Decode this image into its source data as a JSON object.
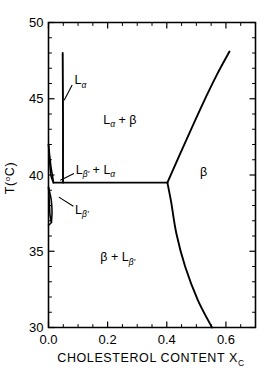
{
  "chart_data": {
    "type": "line",
    "title": "",
    "xlabel": "CHOLESTEROL CONTENT X",
    "xlabel_sub": "C",
    "ylabel": "T(",
    "ylabel_sup": "o",
    "ylabel_tail": "C)",
    "xlim": [
      0.0,
      0.7
    ],
    "ylim": [
      30,
      50
    ],
    "grid": false,
    "legend": "none",
    "x_ticks": [
      0.0,
      0.2,
      0.4,
      0.6
    ],
    "x_tick_labels": [
      "0.0",
      "0.2",
      "0.4",
      "0.6"
    ],
    "x_minor_step": 0.05,
    "y_ticks": [
      30,
      35,
      40,
      45,
      50
    ],
    "y_tick_labels": [
      "30",
      "35",
      "40",
      "45",
      "50"
    ],
    "y_minor_step": 1,
    "series": [
      {
        "name": "L-alpha vertical boundary",
        "comment": "near-vertical phase boundary rising from eutectic to top",
        "points": [
          [
            0.049,
            39.5
          ],
          [
            0.049,
            44.0
          ],
          [
            0.048,
            48.0
          ]
        ]
      },
      {
        "name": "eutectic horizontal line",
        "comment": "three-phase invariant line at T = 39.5 C",
        "points": [
          [
            0.017,
            39.5
          ],
          [
            0.2,
            39.5
          ],
          [
            0.402,
            39.5
          ]
        ]
      },
      {
        "name": "beta upper right boundary",
        "comment": "liquidus rising to the right",
        "points": [
          [
            0.402,
            39.5
          ],
          [
            0.45,
            41.6
          ],
          [
            0.52,
            44.6
          ],
          [
            0.57,
            46.6
          ],
          [
            0.612,
            48.1
          ]
        ]
      },
      {
        "name": "beta lower right boundary",
        "comment": "solidus curving down to the right",
        "points": [
          [
            0.402,
            39.5
          ],
          [
            0.415,
            38.2
          ],
          [
            0.432,
            36.2
          ],
          [
            0.462,
            34.0
          ],
          [
            0.505,
            31.8
          ],
          [
            0.553,
            30.0
          ]
        ]
      },
      {
        "name": "L-alpha lens left branch",
        "comment": "narrow lens near pure phospholipid, upper",
        "points": [
          [
            0.0,
            42.0
          ],
          [
            0.008,
            40.6
          ],
          [
            0.014,
            39.9
          ],
          [
            0.017,
            39.5
          ]
        ]
      },
      {
        "name": "L-alpha lens right branch",
        "comment": "narrow lens near pure phospholipid, lower",
        "points": [
          [
            0.0,
            42.0
          ],
          [
            0.004,
            40.8
          ],
          [
            0.009,
            39.9
          ],
          [
            0.017,
            39.5
          ]
        ]
      },
      {
        "name": "L-beta-prime lens upper branch",
        "points": [
          [
            0.0,
            39.2
          ],
          [
            0.009,
            38.4
          ],
          [
            0.012,
            37.6
          ],
          [
            0.01,
            36.9
          ]
        ]
      },
      {
        "name": "L-beta-prime lens lower branch",
        "points": [
          [
            0.0,
            39.2
          ],
          [
            0.003,
            38.2
          ],
          [
            0.005,
            37.4
          ],
          [
            0.01,
            36.9
          ]
        ]
      },
      {
        "name": "solidus foot",
        "points": [
          [
            0.0,
            36.7
          ],
          [
            0.006,
            36.8
          ],
          [
            0.01,
            36.9
          ]
        ]
      }
    ],
    "annotations": [
      {
        "id": "l-alpha",
        "label": "L",
        "sub": "α",
        "sup": "",
        "x": 0.088,
        "y": 46.2,
        "leader": [
          [
            0.08,
            45.9
          ],
          [
            0.053,
            44.9
          ]
        ]
      },
      {
        "id": "l-alpha-plus-beta",
        "label": "L",
        "sub": "α",
        "tail": " + β",
        "x": 0.185,
        "y": 43.6,
        "leader": null
      },
      {
        "id": "l-beta-prime-plus-l-alpha",
        "label": "L",
        "sub": "β'",
        "tail": " + L",
        "tail_sub": "α",
        "x": 0.092,
        "y": 40.35,
        "leader": [
          [
            0.086,
            40.1
          ],
          [
            0.04,
            39.65
          ]
        ]
      },
      {
        "id": "l-beta-prime",
        "label": "L",
        "sub": "β'",
        "x": 0.09,
        "y": 37.7,
        "leader": [
          [
            0.084,
            37.95
          ],
          [
            0.035,
            38.55
          ]
        ]
      },
      {
        "id": "beta-region",
        "label": "β",
        "x": 0.512,
        "y": 40.2,
        "leader": null
      },
      {
        "id": "beta-plus-l-beta-prime",
        "label": "β + L",
        "sub": "β'",
        "x": 0.175,
        "y": 34.6,
        "leader": null
      }
    ]
  },
  "colors": {
    "ink": "#000000",
    "background": "#ffffff"
  }
}
